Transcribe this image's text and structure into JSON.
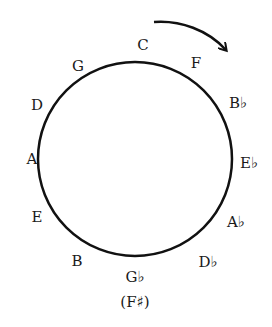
{
  "circle": {
    "cx": 135,
    "cy": 159,
    "r": 97,
    "stroke": "#111111"
  },
  "direction_arrow": "clockwise",
  "notes": [
    {
      "label": "C",
      "x": 143,
      "y": 50
    },
    {
      "label": "F",
      "x": 196,
      "y": 67
    },
    {
      "label": "B♭",
      "x": 238,
      "y": 107
    },
    {
      "label": "E♭",
      "x": 249,
      "y": 168
    },
    {
      "label": "A♭",
      "x": 238,
      "y": 226
    },
    {
      "label": "D♭",
      "x": 208,
      "y": 266
    },
    {
      "label": "G♭",
      "x": 135,
      "y": 281
    },
    {
      "label": "(F♯)",
      "x": 135,
      "y": 306
    },
    {
      "label": "B",
      "x": 76,
      "y": 265
    },
    {
      "label": "E",
      "x": 37,
      "y": 221
    },
    {
      "label": "A",
      "x": 33,
      "y": 162
    },
    {
      "label": "D",
      "x": 37,
      "y": 109
    },
    {
      "label": "G",
      "x": 77,
      "y": 70
    }
  ]
}
